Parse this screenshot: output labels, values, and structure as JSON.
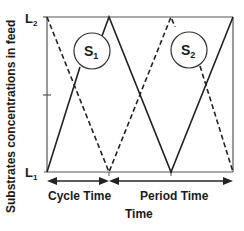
{
  "diagram": {
    "y_axis_label": "Substrates concentrations in feed",
    "x_axis_label": "Time",
    "y_top_label": "L",
    "y_top_sub": "2",
    "y_bottom_label": "L",
    "y_bottom_sub": "1",
    "series": [
      {
        "name": "S",
        "sub": "1",
        "style": "solid"
      },
      {
        "name": "S",
        "sub": "2",
        "style": "dashed"
      }
    ],
    "spans": [
      {
        "label": "Cycle Time"
      },
      {
        "label": "Period Time"
      }
    ],
    "colors": {
      "line": "#222222",
      "background": "#ffffff"
    }
  }
}
